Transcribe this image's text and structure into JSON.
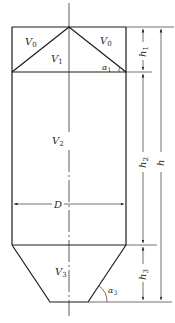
{
  "figure": {
    "type": "vessel-volume-diagram",
    "stroke_color": "#1a1a1a",
    "background": "#ffffff"
  },
  "regions": {
    "v0_left": {
      "base": "V",
      "sub": "0"
    },
    "v0_right": {
      "base": "V",
      "sub": "0"
    },
    "v1": {
      "base": "V",
      "sub": "1"
    },
    "v2": {
      "base": "V",
      "sub": "2"
    },
    "v3": {
      "base": "V",
      "sub": "3"
    }
  },
  "angles": {
    "alpha1": {
      "base": "α",
      "sub": "1"
    },
    "alpha3": {
      "base": "α",
      "sub": "3"
    }
  },
  "dimensions": {
    "h1": {
      "base": "h",
      "sub": "1"
    },
    "h2": {
      "base": "h",
      "sub": "2"
    },
    "h3": {
      "base": "h",
      "sub": "3"
    },
    "h": {
      "base": "h",
      "sub": ""
    },
    "diameter": {
      "base": "D"
    }
  }
}
